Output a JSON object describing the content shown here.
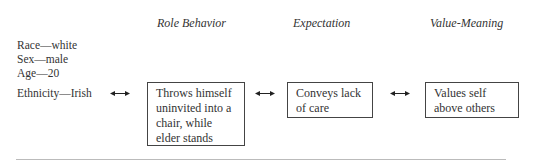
{
  "headers": {
    "role_behavior": "Role Behavior",
    "expectation": "Expectation",
    "value_meaning": "Value-Meaning"
  },
  "attributes": [
    "Race—white",
    "Sex—male",
    "Age—20",
    "Ethnicity—Irish"
  ],
  "boxes": {
    "role_behavior": "Throws himself uninvited into a chair, while elder stands",
    "expectation": "Conveys lack of care",
    "value_meaning": "Values self above others"
  },
  "arrows": [
    {
      "from": "attributes",
      "to": "role_behavior",
      "type": "double-headed"
    },
    {
      "from": "role_behavior",
      "to": "expectation",
      "type": "double-headed"
    },
    {
      "from": "expectation",
      "to": "value_meaning",
      "type": "double-headed"
    }
  ]
}
